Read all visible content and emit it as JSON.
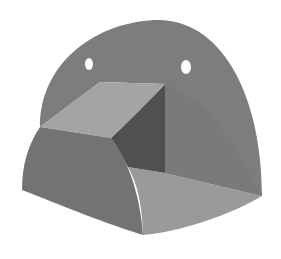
{
  "figure": {
    "colors": {
      "background": "#ffffff",
      "back_plate": "#7d7d7d",
      "block_top_face": "#a4a4a4",
      "block_inner_face": "#505050",
      "block_front_curved_face": "#737373",
      "floor_face": "#9a9a9a",
      "right_side_face": "#858585",
      "hole": "#ffffff"
    },
    "holes": [
      {
        "cx": 89,
        "cy": 64,
        "rx": 4,
        "ry": 6
      },
      {
        "cx": 186,
        "cy": 67,
        "rx": 5,
        "ry": 7
      }
    ]
  }
}
